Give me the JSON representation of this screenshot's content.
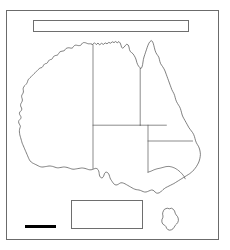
{
  "figure": {
    "name": "australia-outline-map",
    "background_color": "#ffffff",
    "frame_color": "#6b6b6b"
  },
  "title_box": {
    "text": "",
    "placeholder": "",
    "border_color": "#6e6e6e"
  },
  "legend_box": {
    "text": "",
    "placeholder": "",
    "border_color": "#6e6e6e"
  },
  "scale_bar": {
    "label": "",
    "color": "#000000"
  },
  "map": {
    "coast_stroke": "#4a4a4a",
    "border_stroke": "#5a5a5a",
    "land_fill": "#ffffff",
    "regions": [
      {
        "name": "western-australia"
      },
      {
        "name": "northern-territory"
      },
      {
        "name": "queensland"
      },
      {
        "name": "south-australia"
      },
      {
        "name": "new-south-wales"
      },
      {
        "name": "victoria"
      },
      {
        "name": "tasmania"
      }
    ]
  }
}
